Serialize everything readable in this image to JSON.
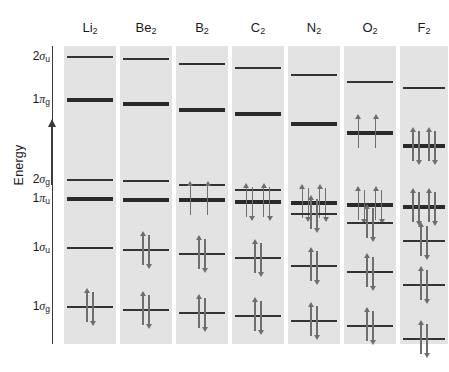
{
  "figure": {
    "type": "molecular-orbital-energy-diagram",
    "axis": {
      "label": "Energy",
      "direction": "increasing-upward",
      "arrow_icon": "up-arrow-icon",
      "ticks_have_values": false
    },
    "orbital_labels": [
      {
        "id": "2sigma_u",
        "base": "2",
        "greek": "σ",
        "sub": "u",
        "y": 57
      },
      {
        "id": "1pi_g",
        "base": "1",
        "greek": "π",
        "sub": "g",
        "y": 100
      },
      {
        "id": "2sigma_g",
        "base": "2",
        "greek": "σ",
        "sub": "g",
        "y": 180
      },
      {
        "id": "1pi_u",
        "base": "1",
        "greek": "π",
        "sub": "u",
        "y": 199
      },
      {
        "id": "1sigma_u",
        "base": "1",
        "greek": "σ",
        "sub": "u",
        "y": 248
      },
      {
        "id": "1sigma_g",
        "base": "1",
        "greek": "σ",
        "sub": "g",
        "y": 307
      }
    ],
    "colors": {
      "panel_background": "#e3e3e3",
      "level_line": "#333333",
      "level_line_thick": "#2a2a2a",
      "electron_arrow": "#6e6e6e",
      "axis": "#3a3a3a",
      "text": "#1a1a1a",
      "page_background": "#ffffff"
    }
  },
  "chart_data": {
    "type": "line",
    "title": "",
    "xlabel": "",
    "ylabel": "Energy",
    "grid": false,
    "legend": "none",
    "categories": [
      "Li2",
      "Be2",
      "B2",
      "C2",
      "N2",
      "O2",
      "F2"
    ],
    "orbitals": [
      "1sigma_g",
      "1sigma_u",
      "1pi_u",
      "2sigma_g",
      "1pi_g",
      "2sigma_u"
    ],
    "note": "y values are pixel rows measured from the top of the 449x372 image; lower y = higher energy",
    "molecules": [
      {
        "name": "Li2",
        "label_base": "Li",
        "label_sub": "2",
        "panel_x": 64,
        "panel_w": 52,
        "levels": [
          {
            "orbital": "2sigma_u",
            "y": 57,
            "thick": false,
            "electrons": 0,
            "pairs": 0
          },
          {
            "orbital": "1pi_g",
            "y": 100,
            "thick": true,
            "electrons": 0,
            "pairs": 0
          },
          {
            "orbital": "2sigma_g",
            "y": 180,
            "thick": false,
            "electrons": 0,
            "pairs": 0
          },
          {
            "orbital": "1pi_u",
            "y": 199,
            "thick": true,
            "electrons": 0,
            "pairs": 0
          },
          {
            "orbital": "1sigma_u",
            "y": 248,
            "thick": false,
            "electrons": 0,
            "pairs": 0
          },
          {
            "orbital": "1sigma_g",
            "y": 307,
            "thick": false,
            "electrons": 2,
            "pairs": 1
          }
        ],
        "total_valence_electrons": 2
      },
      {
        "name": "Be2",
        "label_base": "Be",
        "label_sub": "2",
        "panel_x": 120,
        "panel_w": 52,
        "levels": [
          {
            "orbital": "2sigma_u",
            "y": 59,
            "thick": false,
            "electrons": 0,
            "pairs": 0
          },
          {
            "orbital": "1pi_g",
            "y": 104,
            "thick": true,
            "electrons": 0,
            "pairs": 0
          },
          {
            "orbital": "2sigma_g",
            "y": 181,
            "thick": false,
            "electrons": 0,
            "pairs": 0
          },
          {
            "orbital": "1pi_u",
            "y": 200,
            "thick": true,
            "electrons": 0,
            "pairs": 0
          },
          {
            "orbital": "1sigma_u",
            "y": 250,
            "thick": false,
            "electrons": 2,
            "pairs": 1
          },
          {
            "orbital": "1sigma_g",
            "y": 310,
            "thick": false,
            "electrons": 2,
            "pairs": 1
          }
        ],
        "total_valence_electrons": 4
      },
      {
        "name": "B2",
        "label_base": "B",
        "label_sub": "2",
        "panel_x": 176,
        "panel_w": 52,
        "levels": [
          {
            "orbital": "2sigma_u",
            "y": 64,
            "thick": false,
            "electrons": 0,
            "pairs": 0
          },
          {
            "orbital": "1pi_g",
            "y": 110,
            "thick": true,
            "electrons": 0,
            "pairs": 0
          },
          {
            "orbital": "2sigma_g",
            "y": 185,
            "thick": false,
            "electrons": 0,
            "pairs": 0
          },
          {
            "orbital": "1pi_u",
            "y": 200,
            "thick": true,
            "electrons": 2,
            "unpaired": 2
          },
          {
            "orbital": "1sigma_u",
            "y": 254,
            "thick": false,
            "electrons": 2,
            "pairs": 1
          },
          {
            "orbital": "1sigma_g",
            "y": 313,
            "thick": false,
            "electrons": 2,
            "pairs": 1
          }
        ],
        "total_valence_electrons": 6
      },
      {
        "name": "C2",
        "label_base": "C",
        "label_sub": "2",
        "panel_x": 232,
        "panel_w": 52,
        "levels": [
          {
            "orbital": "2sigma_u",
            "y": 68,
            "thick": false,
            "electrons": 0,
            "pairs": 0
          },
          {
            "orbital": "1pi_g",
            "y": 114,
            "thick": true,
            "electrons": 0,
            "pairs": 0
          },
          {
            "orbital": "2sigma_g",
            "y": 190,
            "thick": false,
            "electrons": 0,
            "pairs": 0
          },
          {
            "orbital": "1pi_u",
            "y": 202,
            "thick": true,
            "electrons": 4,
            "pairs": 2
          },
          {
            "orbital": "1sigma_u",
            "y": 258,
            "thick": false,
            "electrons": 2,
            "pairs": 1
          },
          {
            "orbital": "1sigma_g",
            "y": 316,
            "thick": false,
            "electrons": 2,
            "pairs": 1
          }
        ],
        "total_valence_electrons": 8
      },
      {
        "name": "N2",
        "label_base": "N",
        "label_sub": "2",
        "panel_x": 288,
        "panel_w": 52,
        "levels": [
          {
            "orbital": "2sigma_u",
            "y": 75,
            "thick": false,
            "electrons": 0,
            "pairs": 0
          },
          {
            "orbital": "1pi_g",
            "y": 124,
            "thick": true,
            "electrons": 0,
            "pairs": 0
          },
          {
            "orbital": "1pi_u",
            "y": 203,
            "thick": true,
            "electrons": 4,
            "pairs": 2
          },
          {
            "orbital": "2sigma_g",
            "y": 214,
            "thick": false,
            "electrons": 2,
            "pairs": 1
          },
          {
            "orbital": "1sigma_u",
            "y": 266,
            "thick": false,
            "electrons": 2,
            "pairs": 1
          },
          {
            "orbital": "1sigma_g",
            "y": 321,
            "thick": false,
            "electrons": 2,
            "pairs": 1
          }
        ],
        "total_valence_electrons": 10
      },
      {
        "name": "O2",
        "label_base": "O",
        "label_sub": "2",
        "panel_x": 344,
        "panel_w": 52,
        "levels": [
          {
            "orbital": "2sigma_u",
            "y": 82,
            "thick": false,
            "electrons": 0,
            "pairs": 0
          },
          {
            "orbital": "1pi_g",
            "y": 133,
            "thick": true,
            "electrons": 2,
            "unpaired": 2
          },
          {
            "orbital": "1pi_u",
            "y": 205,
            "thick": true,
            "electrons": 4,
            "pairs": 2
          },
          {
            "orbital": "2sigma_g",
            "y": 223,
            "thick": false,
            "electrons": 2,
            "pairs": 1
          },
          {
            "orbital": "1sigma_u",
            "y": 272,
            "thick": false,
            "electrons": 2,
            "pairs": 1
          },
          {
            "orbital": "1sigma_g",
            "y": 326,
            "thick": false,
            "electrons": 2,
            "pairs": 1
          }
        ],
        "total_valence_electrons": 12
      },
      {
        "name": "F2",
        "label_base": "F",
        "label_sub": "2",
        "panel_x": 400,
        "panel_w": 48,
        "levels": [
          {
            "orbital": "2sigma_u",
            "y": 88,
            "thick": false,
            "electrons": 0,
            "pairs": 0
          },
          {
            "orbital": "1pi_g",
            "y": 146,
            "thick": true,
            "electrons": 4,
            "pairs": 2
          },
          {
            "orbital": "1pi_u",
            "y": 207,
            "thick": true,
            "electrons": 4,
            "pairs": 2
          },
          {
            "orbital": "2sigma_g",
            "y": 241,
            "thick": false,
            "electrons": 2,
            "pairs": 1
          },
          {
            "orbital": "1sigma_u",
            "y": 285,
            "thick": false,
            "electrons": 2,
            "pairs": 1
          },
          {
            "orbital": "1sigma_g",
            "y": 339,
            "thick": false,
            "electrons": 2,
            "pairs": 1
          }
        ],
        "total_valence_electrons": 14
      }
    ]
  }
}
